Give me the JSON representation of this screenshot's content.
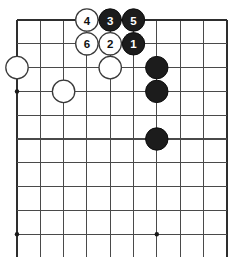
{
  "figure": {
    "name": "go-board-diagram",
    "board_size": 19,
    "visible_columns": 10,
    "visible_rows": 11,
    "colors": {
      "background": "#ffffff",
      "grid_line": "#4a4a4a",
      "edge_line": "#2e2e2e",
      "black_stone": "#1c1c1c",
      "white_stone": "#ffffff",
      "stone_outline": "#3a3a3a",
      "star_point": "#1a1a1a"
    },
    "geometry": {
      "origin_x": 17,
      "origin_y": 20,
      "cell_w": 23.3,
      "cell_h": 23.8,
      "stone_radius": 11.2,
      "star_radius": 2.2
    }
  },
  "grid": {
    "vertical_lines_x": [
      17,
      40.3,
      63.6,
      86.9,
      110.2,
      133.5,
      156.8,
      180.1,
      203.4,
      226.7
    ],
    "horizontal_lines_y": [
      20,
      43.8,
      67.6,
      91.4,
      115.2,
      139,
      162.8,
      186.6,
      210.4,
      234.2
    ],
    "top_edge": true,
    "left_edge": true,
    "right_edge": true,
    "bottom_edge": false
  },
  "star_points": [
    {
      "name": "star-point-left-upper",
      "cx": 17,
      "cy": 91.4
    },
    {
      "name": "star-point-left-lower",
      "cx": 17,
      "cy": 234.2
    },
    {
      "name": "star-point-center-lower",
      "cx": 156.8,
      "cy": 234.2
    }
  ],
  "stones": [
    {
      "id": "w-left-upper",
      "color": "white",
      "label": "",
      "cx": 17,
      "cy": 67.6,
      "name": "white-stone-left-upper"
    },
    {
      "id": "w-left-lower",
      "color": "white",
      "label": "",
      "cx": 63.6,
      "cy": 91.4,
      "name": "white-stone-left-lower"
    },
    {
      "id": "w-center",
      "color": "white",
      "label": "",
      "cx": 110.2,
      "cy": 67.6,
      "name": "white-stone-center"
    },
    {
      "id": "move-4",
      "color": "white",
      "label": "4",
      "cx": 86.9,
      "cy": 20,
      "name": "move-stone-4"
    },
    {
      "id": "move-3",
      "color": "black",
      "label": "3",
      "cx": 110.2,
      "cy": 20,
      "name": "move-stone-3"
    },
    {
      "id": "move-5",
      "color": "black",
      "label": "5",
      "cx": 133.5,
      "cy": 20,
      "name": "move-stone-5"
    },
    {
      "id": "move-6",
      "color": "white",
      "label": "6",
      "cx": 86.9,
      "cy": 43.8,
      "name": "move-stone-6"
    },
    {
      "id": "move-2",
      "color": "white",
      "label": "2",
      "cx": 110.2,
      "cy": 43.8,
      "name": "move-stone-2"
    },
    {
      "id": "move-1",
      "color": "black",
      "label": "1",
      "cx": 133.5,
      "cy": 43.8,
      "name": "move-stone-1"
    },
    {
      "id": "b-right-1",
      "color": "black",
      "label": "",
      "cx": 156.8,
      "cy": 67.6,
      "name": "black-stone-right-upper"
    },
    {
      "id": "b-right-2",
      "color": "black",
      "label": "",
      "cx": 156.8,
      "cy": 91.4,
      "name": "black-stone-right-middle"
    },
    {
      "id": "b-right-3",
      "color": "black",
      "label": "",
      "cx": 156.8,
      "cy": 139,
      "name": "black-stone-right-lower"
    }
  ],
  "move_sequence": [
    {
      "number": "1",
      "color": "black"
    },
    {
      "number": "2",
      "color": "white"
    },
    {
      "number": "3",
      "color": "black"
    },
    {
      "number": "4",
      "color": "white"
    },
    {
      "number": "5",
      "color": "black"
    },
    {
      "number": "6",
      "color": "white"
    }
  ]
}
